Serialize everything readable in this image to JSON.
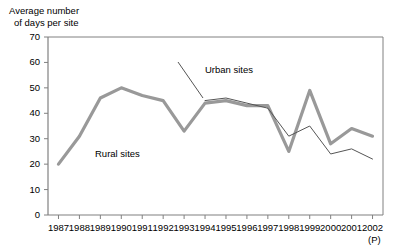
{
  "chart_data": {
    "type": "line",
    "title": "",
    "ylabel": "Average number of days per site",
    "ylabel_lines": [
      "Average number",
      "of days per site"
    ],
    "xlabel": "",
    "x_axis_note": "(P)",
    "categories": [
      "1987",
      "1988",
      "1989",
      "1990",
      "1991",
      "1992",
      "1993",
      "1994",
      "1995",
      "1996",
      "1997",
      "1998",
      "1999",
      "2000",
      "2001",
      "2002"
    ],
    "ylim": [
      0,
      70
    ],
    "yticks": [
      0,
      10,
      20,
      30,
      40,
      50,
      60,
      70
    ],
    "ytick_labels": [
      "0",
      "10",
      "20",
      "30",
      "40",
      "50",
      "60",
      "70"
    ],
    "grid": false,
    "legend_position": "inline-annotations",
    "series": [
      {
        "name": "Rural sites",
        "color": "#999999",
        "line_width": 3.2,
        "x": [
          "1987",
          "1988",
          "1989",
          "1990",
          "1991",
          "1992",
          "1993",
          "1994",
          "1995",
          "1996",
          "1997",
          "1998",
          "1999",
          "2000",
          "2001",
          "2002"
        ],
        "values": [
          20,
          31,
          46,
          50,
          47,
          45,
          33,
          44,
          45,
          43,
          43,
          25,
          49,
          28,
          34,
          31
        ]
      },
      {
        "name": "Urban sites",
        "color": "#555555",
        "line_width": 1,
        "x": [
          "1994",
          "1995",
          "1996",
          "1997",
          "1998",
          "1999",
          "2000",
          "2001",
          "2002"
        ],
        "values": [
          45,
          46,
          44,
          42,
          31,
          35,
          24,
          26,
          22
        ]
      }
    ],
    "annotations": [
      {
        "text": "Rural sites",
        "x": "1990",
        "y": 26
      },
      {
        "text": "Urban sites",
        "x": "1995",
        "y": 58
      }
    ],
    "leader_line": {
      "from": {
        "x_px": 178,
        "y_px": 62
      },
      "to": {
        "x_px": 203,
        "y_px": 98
      }
    },
    "axis_color": "#808080",
    "text_color": "#000000"
  }
}
